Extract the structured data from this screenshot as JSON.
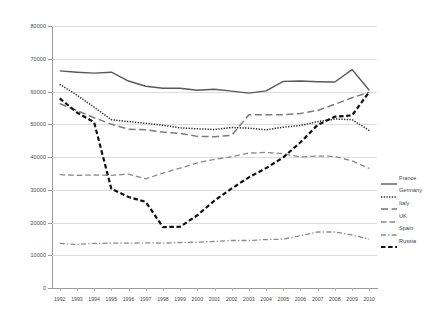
{
  "chart_data": {
    "type": "line",
    "title": "",
    "xlabel": "",
    "ylabel": "",
    "ylim": [
      0,
      80000
    ],
    "ytick_step": 10000,
    "grid": true,
    "legend_position": "right",
    "categories": [
      "1992",
      "1993",
      "1994",
      "1995",
      "1996",
      "1997",
      "1998",
      "1999",
      "2000",
      "2001",
      "2002",
      "2003",
      "2004",
      "2005",
      "2006",
      "2007",
      "2008",
      "2009",
      "2010"
    ],
    "yticks": [
      "0",
      "10000",
      "20000",
      "30000",
      "40000",
      "50000",
      "60000",
      "70000",
      "80000"
    ],
    "series": [
      {
        "name": "France",
        "style": "solid",
        "color": "#595959",
        "values": [
          66300,
          65900,
          65600,
          65900,
          63200,
          61600,
          61000,
          61000,
          60400,
          60700,
          60100,
          59500,
          60200,
          63100,
          63200,
          63000,
          62900,
          66700,
          60400
        ]
      },
      {
        "name": "Germany",
        "style": "dotted",
        "color": "#2b2b2b",
        "values": [
          62200,
          58900,
          55200,
          51400,
          50800,
          50300,
          49700,
          48900,
          48600,
          48400,
          49000,
          48800,
          48300,
          49100,
          49600,
          50800,
          51600,
          51400,
          48100
        ]
      },
      {
        "name": "Italy",
        "style": "dashed-long",
        "color": "#7a7a7a",
        "values": [
          56300,
          54200,
          52000,
          50000,
          48500,
          48300,
          47600,
          47200,
          46300,
          46200,
          46600,
          52900,
          52900,
          52900,
          53300,
          54200,
          56100,
          58100,
          59800
        ]
      },
      {
        "name": "UK",
        "style": "dashed-medium",
        "color": "#8a8a8a",
        "values": [
          34600,
          34400,
          34500,
          34400,
          34800,
          33300,
          35100,
          36600,
          38200,
          39300,
          40100,
          41200,
          41400,
          41000,
          40000,
          40300,
          40200,
          38800,
          36500
        ]
      },
      {
        "name": "Spain",
        "style": "dash-dot",
        "color": "#8a8a8a",
        "values": [
          13600,
          13300,
          13600,
          13700,
          13700,
          13800,
          13700,
          13900,
          14000,
          14200,
          14500,
          14500,
          14800,
          14900,
          16000,
          17100,
          17100,
          16200,
          14900
        ]
      },
      {
        "name": "Russia",
        "style": "dashed-bold",
        "color": "#111111",
        "values": [
          57900,
          53600,
          50600,
          30300,
          27800,
          26300,
          18600,
          18700,
          22200,
          26700,
          30400,
          33800,
          36600,
          39900,
          44500,
          49800,
          52300,
          52700,
          59900
        ]
      }
    ]
  },
  "legend": {
    "items": [
      {
        "label": "France"
      },
      {
        "label": "Germany"
      },
      {
        "label": "Italy"
      },
      {
        "label": "UK"
      },
      {
        "label": "Spain"
      },
      {
        "label": "Russia"
      }
    ]
  }
}
